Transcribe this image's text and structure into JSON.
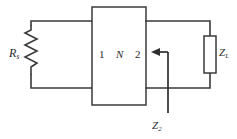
{
  "diagram": {
    "background_color": "#ffffff",
    "line_color": "#3a3a3a",
    "text_color": "#2b2b2b"
  },
  "labels": {
    "source_resistor": "R",
    "source_resistor_subscript": "s",
    "port1": "1",
    "network": "N",
    "port2": "2",
    "load_impedance": "Z",
    "load_impedance_subscript": "L",
    "input_impedance": "Z",
    "input_impedance_subscript": "2"
  },
  "components": {
    "source_resistor": {
      "name": "source-resistor",
      "type": "resistor",
      "orientation": "vertical",
      "symbol": "zigzag"
    },
    "network_box": {
      "name": "two-port-network",
      "type": "black-box",
      "ports": [
        "1",
        "2"
      ],
      "designator": "N"
    },
    "load_impedance": {
      "name": "load-impedance",
      "type": "impedance",
      "orientation": "vertical",
      "symbol": "rectangle"
    },
    "impedance_arrow": {
      "name": "input-impedance-arrow",
      "direction": "left",
      "points_at": "port-2"
    }
  }
}
